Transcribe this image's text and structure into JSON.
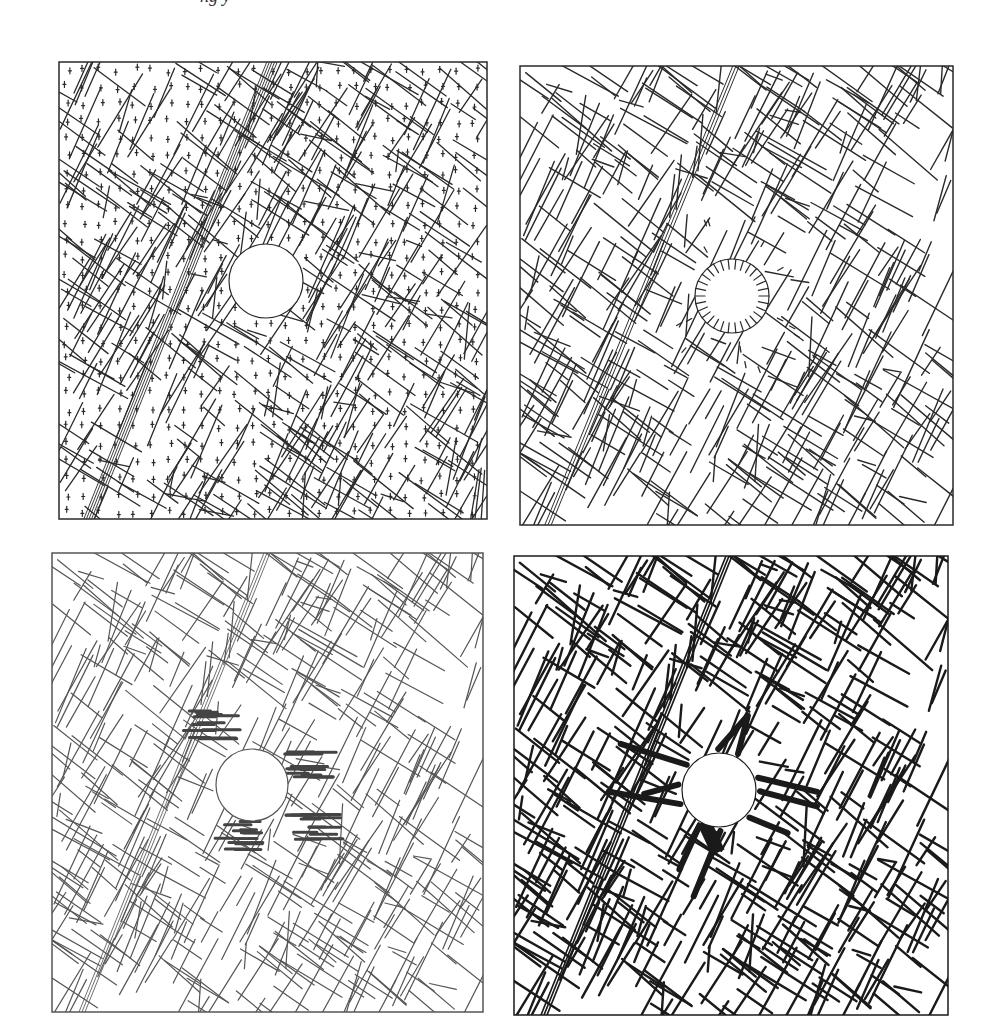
{
  "header": {
    "cropped_caption": "ng                                             y"
  },
  "figure": {
    "background": "#ffffff",
    "panels": [
      {
        "id": "a",
        "description": "Jointed rock mass block network with velocity markers (crosses) and circular excavation",
        "x": 59,
        "y": 62,
        "w": 428,
        "h": 457,
        "stroke": "#2a2a2a",
        "stroke_width": 1.3,
        "dashed": false,
        "tunnel": {
          "cx": 207,
          "cy": 219,
          "r": 37
        },
        "fault": {
          "x1": 213,
          "y1": 0,
          "x2": 30,
          "y2": 457,
          "lines": 5,
          "spacing": 2.6
        },
        "markers": "crosses",
        "seed": 11
      },
      {
        "id": "b",
        "description": "Block network with displacement vectors radiating into the excavation",
        "x": 520,
        "y": 66,
        "w": 433,
        "h": 459,
        "stroke": "#2a2a2a",
        "stroke_width": 1.4,
        "dashed": false,
        "tunnel": {
          "cx": 212,
          "cy": 230,
          "r": 37
        },
        "fault": {
          "x1": 216,
          "y1": 0,
          "x2": 28,
          "y2": 459,
          "lines": 3,
          "spacing": 3.2
        },
        "markers": "arrows",
        "seed": 23
      },
      {
        "id": "c",
        "description": "Block network (dotted print) with hatched slip/yield zones around excavation",
        "x": 52,
        "y": 553,
        "w": 431,
        "h": 459,
        "stroke": "#555555",
        "stroke_width": 1.2,
        "dashed": false,
        "tunnel": {
          "cx": 200,
          "cy": 232,
          "r": 36
        },
        "fault": {
          "x1": 215,
          "y1": 0,
          "x2": 30,
          "y2": 459,
          "lines": 3,
          "spacing": 3.0
        },
        "markers": "hatch",
        "seed": 23
      },
      {
        "id": "d",
        "description": "Block network with thick lines representing joint normal stress, concentrated around excavation",
        "x": 514,
        "y": 556,
        "w": 434,
        "h": 459,
        "stroke": "#1a1a1a",
        "stroke_width": 2.4,
        "dashed": false,
        "tunnel": {
          "cx": 205,
          "cy": 234,
          "r": 37
        },
        "fault": {
          "x1": 215,
          "y1": 0,
          "x2": 30,
          "y2": 459,
          "lines": 3,
          "spacing": 3.0
        },
        "markers": "stress",
        "seed": 23
      }
    ]
  }
}
